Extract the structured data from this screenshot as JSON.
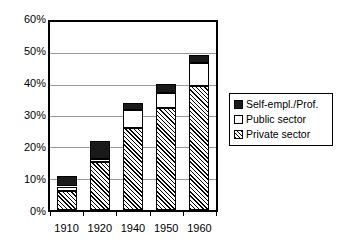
{
  "chart_data": {
    "type": "bar",
    "subtype": "stacked-bar",
    "title": "",
    "subtitle": "",
    "xlabel": "",
    "ylabel": "",
    "categories": [
      "1910",
      "1920",
      "1940",
      "1950",
      "1960"
    ],
    "series": [
      {
        "name": "Private sector",
        "values": [
          6.0,
          15.2,
          26.3,
          32.6,
          39.7
        ],
        "fill": "diagonal-hatch",
        "color": "#000000"
      },
      {
        "name": "Public sector",
        "values": [
          1.5,
          1.2,
          5.7,
          4.8,
          7.3
        ],
        "fill": "solid",
        "color": "#ffffff"
      },
      {
        "name": "Self-empl./Prof.",
        "values": [
          3.2,
          5.6,
          2.2,
          2.8,
          2.5
        ],
        "fill": "solid",
        "color": "#1a1a1a"
      }
    ],
    "totals": [
      10.7,
      22.0,
      34.2,
      40.2,
      49.5
    ],
    "ylim": [
      0,
      60
    ],
    "yticks": [
      "0%",
      "10%",
      "20%",
      "30%",
      "40%",
      "50%",
      "60%"
    ],
    "ytick_values": [
      0,
      10,
      20,
      30,
      40,
      50,
      60
    ],
    "grid": true,
    "grid_axis": "y",
    "legend_position": "right",
    "legend_order": [
      "Self-empl./Prof.",
      "Public sector",
      "Private sector"
    ],
    "value_unit": "percent"
  },
  "legend": {
    "items": [
      {
        "label": "Self-empl./Prof.",
        "swatch": "black-square-icon"
      },
      {
        "label": "Public sector",
        "swatch": "white-square-icon"
      },
      {
        "label": "Private sector",
        "swatch": "hatched-square-icon"
      }
    ]
  },
  "colors": {
    "axis": "#000000",
    "gridline": "#999999",
    "plot_background": "#ffffff",
    "self_employed": "#1a1a1a",
    "public_sector": "#ffffff",
    "private_sector_hatch": "#000000"
  }
}
